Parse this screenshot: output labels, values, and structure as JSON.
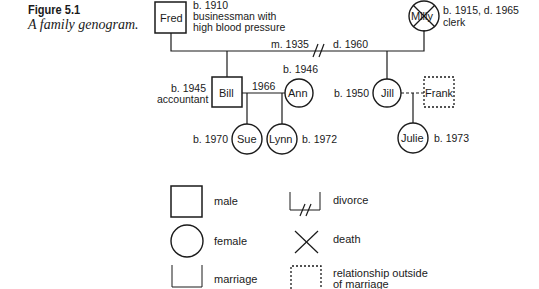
{
  "figure": {
    "number": "Figure 5.1",
    "caption": "A family genogram."
  },
  "people": {
    "fred": {
      "name": "Fred",
      "line1": "b. 1910",
      "line2": "businessman with",
      "line3": "high blood pressure"
    },
    "milly": {
      "name": "Milly",
      "line1": "b. 1915, d. 1965",
      "line2": "clerk"
    },
    "bill": {
      "name": "Bill",
      "line1": "b. 1945",
      "line2": "accountant"
    },
    "ann": {
      "name": "Ann",
      "line1": "b. 1946"
    },
    "jill": {
      "name": "Jill",
      "line1": "b. 1950"
    },
    "frank": {
      "name": "Frank"
    },
    "sue": {
      "name": "Sue",
      "line1": "b. 1970"
    },
    "lynn": {
      "name": "Lynn",
      "line1": "b. 1972"
    },
    "julie": {
      "name": "Julie",
      "line1": "b. 1973"
    }
  },
  "relationships": {
    "fred_milly_marriage": "m. 1935",
    "fred_milly_divorce": "d. 1960",
    "bill_ann_marriage": "1966"
  },
  "legend": {
    "male": "male",
    "female": "female",
    "marriage": "marriage",
    "divorce": "divorce",
    "death": "death",
    "outside_line1": "relationship outside",
    "outside_line2": "of marriage"
  }
}
